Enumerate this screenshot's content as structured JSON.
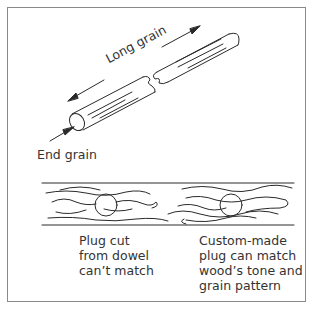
{
  "figure": {
    "top_diagram": {
      "long_grain_label": "Long grain",
      "end_grain_label": "End grain"
    },
    "bottom_diagram": {
      "left_caption": "Plug cut\nfrom dowel\ncan’t match",
      "right_caption": "Custom-made\nplug can match\nwood’s tone and\ngrain pattern"
    },
    "colors": {
      "line": "#2a2a2a",
      "border": "#8a8a8a",
      "background": "#ffffff"
    }
  }
}
